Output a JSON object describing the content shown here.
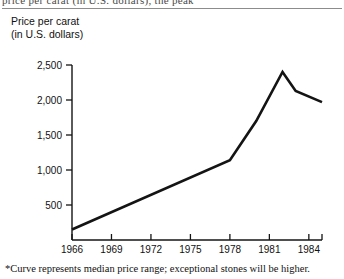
{
  "page": {
    "clipped_header_fragment": "price per carat  (in U.S. dollars),              the peak",
    "footnote": "*Curve represents median price range; exceptional stones will be higher."
  },
  "caption": {
    "line1": "Price per carat",
    "line2": "(in U.S. dollars)"
  },
  "colors": {
    "curve": "#141414",
    "axis": "#141414",
    "text": "#111111",
    "rule": "#8c8c8c",
    "background": "#ffffff"
  },
  "chart_data": {
    "type": "line",
    "title": "",
    "xlabel": "",
    "ylabel": "Price per carat (in U.S. dollars)",
    "xlim": [
      1966,
      1985
    ],
    "ylim": [
      0,
      2500
    ],
    "grid": false,
    "legend": "none",
    "xticks": [
      1966,
      1969,
      1972,
      1975,
      1978,
      1981,
      1984,
      1985
    ],
    "xtick_labels": [
      "1966",
      "1969",
      "1972",
      "1975",
      "1978",
      "1981",
      "1984",
      "1985"
    ],
    "yticks": [
      500,
      1000,
      1500,
      2000,
      2500
    ],
    "ytick_labels": [
      "500",
      "1,000",
      "1,500",
      "2,000",
      "2,500"
    ],
    "x": [
      1966,
      1978,
      1980,
      1982,
      1983,
      1985
    ],
    "values": [
      150,
      1140,
      1700,
      2400,
      2130,
      1970
    ],
    "series": [
      {
        "name": "Median price per carat",
        "x": [
          1966,
          1978,
          1980,
          1982,
          1983,
          1985
        ],
        "values": [
          150,
          1140,
          1700,
          2400,
          2130,
          1970
        ]
      }
    ],
    "annotations": [
      "*Curve represents median price range; exceptional stones will be higher."
    ]
  }
}
